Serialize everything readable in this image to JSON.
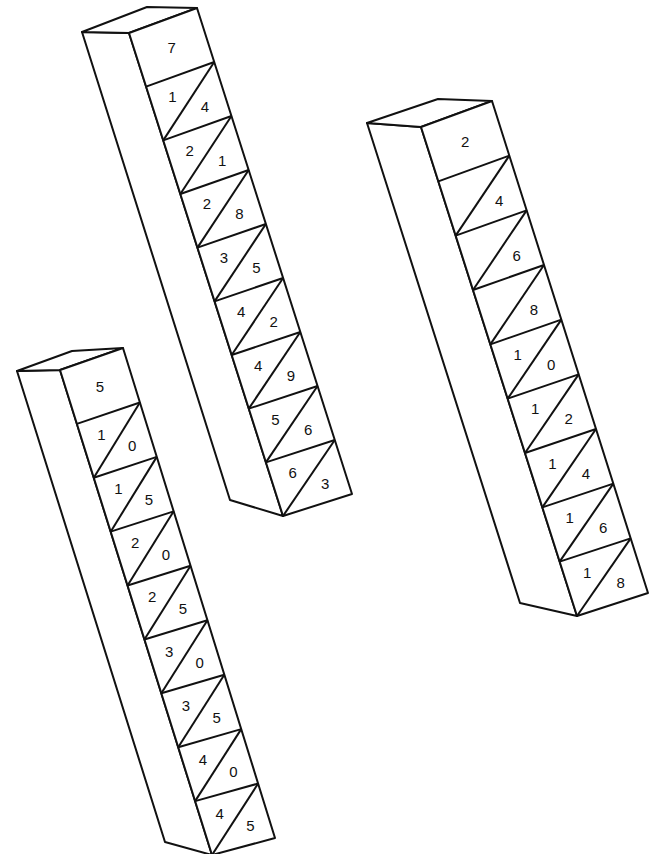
{
  "rods": [
    {
      "id": "rod-7",
      "index": "7",
      "cells": [
        [
          "1",
          "4"
        ],
        [
          "2",
          "1"
        ],
        [
          "2",
          "8"
        ],
        [
          "3",
          "5"
        ],
        [
          "4",
          "2"
        ],
        [
          "4",
          "9"
        ],
        [
          "5",
          "6"
        ],
        [
          "6",
          "3"
        ]
      ]
    },
    {
      "id": "rod-5",
      "index": "5",
      "cells": [
        [
          "1",
          "0"
        ],
        [
          "1",
          "5"
        ],
        [
          "2",
          "0"
        ],
        [
          "2",
          "5"
        ],
        [
          "3",
          "0"
        ],
        [
          "3",
          "5"
        ],
        [
          "4",
          "0"
        ],
        [
          "4",
          "5"
        ]
      ]
    },
    {
      "id": "rod-2",
      "index": "2",
      "cells": [
        [
          "",
          "4"
        ],
        [
          "",
          "6"
        ],
        [
          "",
          "8"
        ],
        [
          "1",
          "0"
        ],
        [
          "1",
          "2"
        ],
        [
          "1",
          "4"
        ],
        [
          "1",
          "6"
        ],
        [
          "1",
          "8"
        ]
      ]
    }
  ]
}
